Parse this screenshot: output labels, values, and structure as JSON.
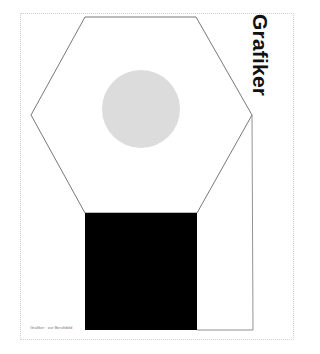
{
  "poster": {
    "title": "Grafiker",
    "caption": "Grafiker · zur Berufsbild",
    "colors": {
      "background": "#ffffff",
      "outline": "#555555",
      "circle": "#dcdcdc",
      "block": "#000000",
      "frame": "#cfcfcf",
      "title": "#111111"
    },
    "shapes": [
      "hexagon-outline",
      "gray-circle",
      "black-rectangle",
      "right-column-outline"
    ]
  }
}
